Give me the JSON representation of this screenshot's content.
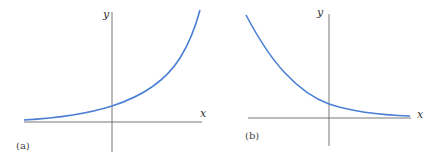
{
  "panels": [
    {
      "id": "a",
      "label": "(a)",
      "x_axis_label": "x",
      "y_axis_label": "y",
      "curve": "exponential growth",
      "curve_color": "#4a7fd4"
    },
    {
      "id": "b",
      "label": "(b)",
      "x_axis_label": "x",
      "y_axis_label": "y",
      "curve": "exponential decay",
      "curve_color": "#4a7fd4"
    }
  ],
  "axis_color": "#555555"
}
